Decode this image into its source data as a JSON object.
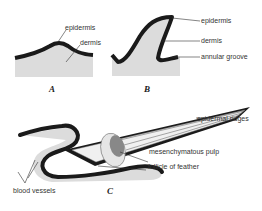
{
  "figure": {
    "panels": [
      {
        "id": "A",
        "label": "A",
        "annotations": [
          "epidermis",
          "dermis"
        ]
      },
      {
        "id": "B",
        "label": "B",
        "annotations": [
          "epidermis",
          "dermis",
          "annular groove"
        ]
      },
      {
        "id": "C",
        "label": "C",
        "annotations": [
          "epidermal ridges",
          "mesenchymatous pulp",
          "follicle of feather",
          "blood vessels"
        ]
      }
    ]
  },
  "labels": {
    "a_epidermis": "epidermis",
    "a_dermis": "dermis",
    "b_epidermis": "epidermis",
    "b_dermis": "dermis",
    "b_annular_groove": "annular groove",
    "c_epidermal_ridges": "epidermal ridges",
    "c_pulp": "mesenchymatous pulp",
    "c_follicle": "follicle of feather",
    "c_blood_vessels": "blood vessels",
    "panel_a": "A",
    "panel_b": "B",
    "panel_c": "C"
  },
  "colors": {
    "epidermis": "#1a1a1a",
    "dermis": "#dcdcdc",
    "background": "#ffffff"
  }
}
